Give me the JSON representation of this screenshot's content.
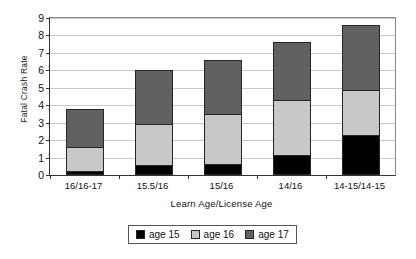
{
  "chart_data": {
    "type": "bar",
    "subtype": "stacked-bar",
    "title": "",
    "xlabel": "Learn Age/License Age",
    "ylabel": "Fatal Crash Rate",
    "categories": [
      "16/16-17",
      "15.5/16",
      "15/16",
      "14/16",
      "14-15/14-15"
    ],
    "series": [
      {
        "name": "age 15",
        "color": "#000000",
        "values": [
          0.25,
          0.55,
          0.65,
          1.15,
          2.3
        ]
      },
      {
        "name": "age 16",
        "color": "#c8c8c8",
        "values": [
          1.35,
          2.4,
          2.85,
          3.15,
          2.6
        ]
      },
      {
        "name": "age 17",
        "color": "#616161",
        "values": [
          2.2,
          3.05,
          3.1,
          3.35,
          3.7
        ]
      }
    ],
    "cumulative_tops": [
      [
        0.25,
        1.6,
        3.8
      ],
      [
        0.55,
        2.95,
        6.0
      ],
      [
        0.65,
        3.5,
        6.6
      ],
      [
        1.15,
        4.3,
        7.65
      ],
      [
        2.3,
        4.9,
        8.6
      ]
    ],
    "totals": [
      3.8,
      6.0,
      6.6,
      7.65,
      8.6
    ],
    "ylim": [
      0,
      9
    ],
    "yticks": [
      0,
      1,
      2,
      3,
      4,
      5,
      6,
      7,
      8,
      9
    ],
    "ytick_labels": [
      "0",
      "1",
      "2",
      "3",
      "4",
      "5",
      "6",
      "7",
      "8",
      "9"
    ],
    "grid": "horizontal",
    "legend_position": "bottom",
    "legend_entries": [
      "age 15",
      "age 16",
      "age 17"
    ]
  },
  "colors": {
    "age_15": "#000000",
    "age_16": "#c8c8c8",
    "age_17": "#616161",
    "gridline": "#c9c9c9",
    "axis": "#333333",
    "background": "#ffffff"
  }
}
